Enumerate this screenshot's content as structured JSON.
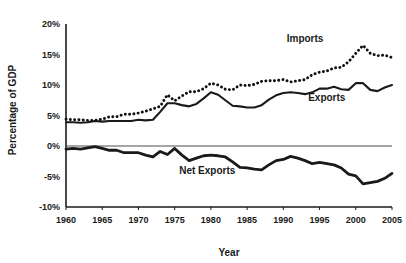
{
  "chart_data": {
    "type": "line",
    "title": "",
    "xlabel": "Year",
    "ylabel": "Percentage of GDP",
    "xlim": [
      1960,
      2005
    ],
    "ylim": [
      -10,
      20
    ],
    "grid": false,
    "legend_position": "inline-annotations",
    "x_ticks": [
      "1960",
      "1965",
      "1970",
      "1975",
      "1980",
      "1985",
      "1990",
      "1995",
      "2000",
      "2005"
    ],
    "x_tick_values": [
      1960,
      1965,
      1970,
      1975,
      1980,
      1985,
      1990,
      1995,
      2000,
      2005
    ],
    "y_ticks": [
      "20%",
      "15%",
      "10%",
      "5%",
      "0%",
      "-5%",
      "-10%"
    ],
    "y_tick_values": [
      20,
      15,
      10,
      5,
      0,
      -5,
      -10
    ],
    "x": [
      1960,
      1961,
      1962,
      1963,
      1964,
      1965,
      1966,
      1967,
      1968,
      1969,
      1970,
      1971,
      1972,
      1973,
      1974,
      1975,
      1976,
      1977,
      1978,
      1979,
      1980,
      1981,
      1982,
      1983,
      1984,
      1985,
      1986,
      1987,
      1988,
      1989,
      1990,
      1991,
      1992,
      1993,
      1994,
      1995,
      1996,
      1997,
      1998,
      1999,
      2000,
      2001,
      2002,
      2003,
      2004,
      2005
    ],
    "series": [
      {
        "name": "Imports",
        "style": "dotted",
        "label": "Imports",
        "values": [
          4.4,
          4.3,
          4.3,
          4.2,
          4.2,
          4.4,
          4.8,
          4.8,
          5.2,
          5.2,
          5.4,
          5.7,
          6.1,
          6.5,
          8.4,
          7.4,
          8.2,
          8.9,
          8.9,
          9.4,
          10.3,
          10.0,
          9.3,
          9.2,
          10.0,
          9.9,
          10.1,
          10.6,
          10.7,
          10.7,
          10.9,
          10.5,
          10.7,
          10.9,
          11.7,
          12.1,
          12.3,
          12.8,
          12.9,
          13.8,
          15.2,
          16.5,
          15.2,
          14.8,
          14.9,
          14.5
        ]
      },
      {
        "name": "Exports",
        "style": "solid",
        "label": "Exports",
        "values": [
          3.9,
          3.9,
          3.8,
          3.9,
          4.1,
          4.0,
          4.1,
          4.1,
          4.1,
          4.1,
          4.3,
          4.2,
          4.3,
          5.6,
          7.0,
          7.0,
          6.7,
          6.5,
          6.9,
          7.8,
          8.8,
          8.4,
          7.5,
          6.6,
          6.5,
          6.3,
          6.3,
          6.7,
          7.6,
          8.3,
          8.7,
          8.8,
          8.7,
          8.5,
          8.8,
          9.4,
          9.4,
          9.7,
          9.3,
          9.2,
          10.3,
          10.3,
          9.2,
          9.0,
          9.6,
          10.0
        ]
      },
      {
        "name": "Net Exports",
        "style": "thick-solid",
        "label": "Net Exports",
        "values": [
          -0.5,
          -0.4,
          -0.5,
          -0.3,
          -0.1,
          -0.4,
          -0.7,
          -0.7,
          -1.1,
          -1.1,
          -1.1,
          -1.5,
          -1.8,
          -0.9,
          -1.4,
          -0.4,
          -1.5,
          -2.4,
          -2.0,
          -1.6,
          -1.5,
          -1.6,
          -1.8,
          -2.6,
          -3.5,
          -3.6,
          -3.8,
          -3.9,
          -3.1,
          -2.4,
          -2.2,
          -1.7,
          -2.0,
          -2.4,
          -2.9,
          -2.7,
          -2.9,
          -3.1,
          -3.6,
          -4.6,
          -4.9,
          -6.2,
          -6.0,
          -5.8,
          -5.3,
          -4.5
        ]
      }
    ],
    "annotations": [
      {
        "text": "Imports",
        "x": 1993.0,
        "y": 17.0
      },
      {
        "text": "Exports",
        "x": 1996.0,
        "y": 7.3
      },
      {
        "text": "Net Exports",
        "x": 1979.5,
        "y": -4.6
      }
    ],
    "colors": {
      "line": "#1a1a1a",
      "axis": "#1a1a1a",
      "zero_line": "#4d4d4d",
      "background": "#ffffff"
    }
  }
}
